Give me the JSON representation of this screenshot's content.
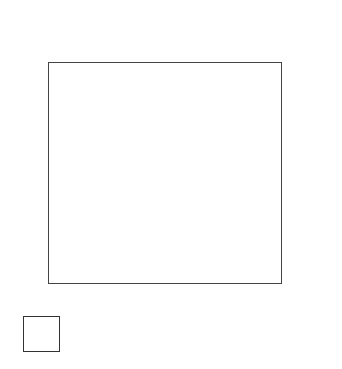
{
  "chart_data": {
    "type": "scatter",
    "xlabel": "X1",
    "ylabel": "X2",
    "x_ticks": [
      "0.2",
      "0.4",
      "0.6",
      "0.8"
    ],
    "y_ticks": [
      "0.8",
      "0.6",
      "0.4",
      "0.2"
    ],
    "xlim": [
      0,
      1
    ],
    "ylim": [
      0,
      1
    ],
    "grid_rows": 6,
    "grid_cols": 6,
    "top_strip_label": "X4",
    "right_strip_label": "X3",
    "corner_panel": {
      "x_label": "X1",
      "y_label": "X2"
    },
    "grid_on": false,
    "legend": "none"
  },
  "labels": {
    "x4": "X",
    "x4_sub": "4",
    "x2": "X",
    "x2_sub": "2",
    "x1_axis": "X",
    "x1_axis_sub": "1",
    "x1_corner": "X",
    "x1_corner_sub": "1",
    "x3": "X",
    "x3_sub": "3",
    "corner_x2": "X",
    "corner_x2_sub": "2"
  },
  "ticks": {
    "x": [
      "0.2",
      "0.4",
      "0.6",
      "0.8"
    ],
    "y": [
      "0.8",
      "0.6",
      "0.4",
      "0.2"
    ]
  },
  "top_strip": [
    [
      [
        0.05,
        0.1
      ],
      [
        0.12,
        0.15
      ],
      [
        0.2,
        0.12
      ],
      [
        0.3,
        0.2
      ],
      [
        0.4,
        0.18
      ],
      [
        0.5,
        0.25
      ],
      [
        0.6,
        0.15
      ],
      [
        0.72,
        0.28
      ],
      [
        0.85,
        0.22
      ],
      [
        0.15,
        0.08
      ]
    ],
    [
      [
        0.1,
        0.45
      ],
      [
        0.2,
        0.3
      ],
      [
        0.3,
        0.5
      ],
      [
        0.35,
        0.2
      ],
      [
        0.45,
        0.35
      ],
      [
        0.5,
        0.42
      ],
      [
        0.6,
        0.3
      ],
      [
        0.7,
        0.5
      ],
      [
        0.8,
        0.35
      ],
      [
        0.9,
        0.4
      ],
      [
        0.25,
        0.55
      ],
      [
        0.55,
        0.25
      ]
    ],
    [
      [
        0.1,
        0.5
      ],
      [
        0.12,
        0.6
      ],
      [
        0.4,
        0.45
      ],
      [
        0.5,
        0.4
      ],
      [
        0.55,
        0.5
      ],
      [
        0.65,
        0.42
      ],
      [
        0.8,
        0.45
      ],
      [
        0.6,
        0.55
      ]
    ],
    [
      [
        0.1,
        0.4
      ],
      [
        0.2,
        0.45
      ],
      [
        0.25,
        0.5
      ],
      [
        0.3,
        0.42
      ],
      [
        0.4,
        0.35
      ],
      [
        0.6,
        0.45
      ],
      [
        0.85,
        0.55
      ],
      [
        0.22,
        0.55
      ]
    ],
    [
      [
        0.1,
        0.7
      ],
      [
        0.15,
        0.75
      ],
      [
        0.25,
        0.72
      ],
      [
        0.35,
        0.7
      ],
      [
        0.45,
        0.75
      ],
      [
        0.55,
        0.78
      ],
      [
        0.65,
        0.72
      ],
      [
        0.8,
        0.75
      ],
      [
        0.2,
        0.8
      ]
    ],
    [
      [
        0.1,
        0.85
      ],
      [
        0.2,
        0.88
      ],
      [
        0.35,
        0.8
      ],
      [
        0.45,
        0.92
      ],
      [
        0.55,
        0.85
      ],
      [
        0.65,
        0.8
      ],
      [
        0.75,
        0.78
      ]
    ]
  ],
  "grid_points": [
    [
      [
        [
          0.08,
          0.08
        ],
        [
          0.15,
          0.12
        ],
        [
          0.22,
          0.06
        ]
      ],
      [
        [
          0.22,
          0.2
        ],
        [
          0.12,
          0.35
        ]
      ],
      [
        [
          0.15,
          0.22
        ],
        [
          0.15,
          0.35
        ],
        [
          0.18,
          0.3
        ]
      ],
      [
        [
          0.05,
          0.3
        ]
      ],
      [
        [
          0.12,
          0.6
        ],
        [
          0.3,
          0.62
        ]
      ],
      [
        [
          0.15,
          0.7
        ],
        [
          0.2,
          0.7
        ]
      ]
    ],
    [
      [
        [
          0.25,
          0.2
        ]
      ],
      [
        [
          0.2,
          0.3
        ],
        [
          0.2,
          0.45
        ],
        [
          0.25,
          0.5
        ],
        [
          0.35,
          0.45
        ],
        [
          0.3,
          0.55
        ]
      ],
      [],
      [
        [
          0.2,
          0.4
        ],
        [
          0.25,
          0.45
        ],
        [
          0.3,
          0.5
        ],
        [
          0.22,
          0.55
        ]
      ],
      [
        [
          0.2,
          0.6
        ],
        [
          0.3,
          0.6
        ],
        [
          0.35,
          0.62
        ]
      ],
      [
        [
          0.3,
          0.95
        ]
      ]
    ],
    [
      [
        [
          0.35,
          0.1
        ],
        [
          0.42,
          0.12
        ],
        [
          0.48,
          0.14
        ]
      ],
      [
        [
          0.32,
          0.18
        ],
        [
          0.35,
          0.28
        ]
      ],
      [
        [
          0.4,
          0.4
        ],
        [
          0.48,
          0.35
        ],
        [
          0.45,
          0.45
        ]
      ],
      [
        [
          0.2,
          0.45
        ],
        [
          0.22,
          0.55
        ],
        [
          0.25,
          0.6
        ]
      ],
      [
        [
          0.45,
          0.4
        ],
        [
          0.5,
          0.4
        ],
        [
          0.55,
          0.38
        ]
      ],
      [
        [
          0.7,
          0.6
        ],
        [
          0.75,
          0.55
        ]
      ]
    ],
    [
      [
        [
          0.45,
          0.1
        ],
        [
          0.5,
          0.12
        ],
        [
          0.55,
          0.15
        ]
      ],
      [
        [
          0.45,
          0.25
        ],
        [
          0.5,
          0.2
        ],
        [
          0.55,
          0.18
        ]
      ],
      [
        [
          0.6,
          0.3
        ],
        [
          0.62,
          0.4
        ],
        [
          0.65,
          0.5
        ]
      ],
      [
        [
          0.5,
          0.5
        ],
        [
          0.52,
          0.6
        ]
      ],
      [
        [
          0.4,
          0.6
        ],
        [
          0.45,
          0.7
        ],
        [
          0.5,
          0.65
        ]
      ],
      [
        [
          0.4,
          0.6
        ]
      ]
    ],
    [
      [
        [
          0.7,
          0.35
        ],
        [
          0.72,
          0.45
        ]
      ],
      [
        [
          0.75,
          0.3
        ],
        [
          0.8,
          0.4
        ]
      ],
      [],
      [
        [
          0.65,
          0.75
        ]
      ],
      [
        [
          0.75,
          0.7
        ],
        [
          0.8,
          0.75
        ]
      ],
      [
        [
          0.75,
          0.5
        ]
      ]
    ],
    [
      [
        [
          0.85,
          0.55
        ]
      ],
      [
        [
          0.85,
          0.6
        ],
        [
          0.9,
          0.65
        ]
      ],
      [
        [
          0.9,
          0.7
        ]
      ],
      [
        [
          0.85,
          0.85
        ]
      ],
      [
        [
          0.9,
          0.85
        ]
      ],
      [
        [
          0.9,
          0.9
        ]
      ]
    ]
  ],
  "right_strip": [
    [
      [
        0.1,
        0.1
      ],
      [
        0.2,
        0.15
      ],
      [
        0.15,
        0.25
      ],
      [
        0.25,
        0.3
      ],
      [
        0.12,
        0.4
      ],
      [
        0.2,
        0.5
      ],
      [
        0.15,
        0.6
      ],
      [
        0.1,
        0.7
      ],
      [
        0.3,
        0.7
      ],
      [
        0.2,
        0.8
      ],
      [
        0.25,
        0.2
      ],
      [
        0.35,
        0.55
      ]
    ],
    [
      [
        0.3,
        0.1
      ],
      [
        0.25,
        0.35
      ],
      [
        0.35,
        0.4
      ],
      [
        0.3,
        0.5
      ],
      [
        0.4,
        0.55
      ],
      [
        0.25,
        0.6
      ],
      [
        0.35,
        0.65
      ],
      [
        0.45,
        0.7
      ],
      [
        0.3,
        0.75
      ],
      [
        0.4,
        0.9
      ]
    ],
    [
      [
        0.35,
        0.15
      ],
      [
        0.4,
        0.25
      ],
      [
        0.45,
        0.35
      ],
      [
        0.5,
        0.4
      ],
      [
        0.38,
        0.5
      ],
      [
        0.45,
        0.6
      ],
      [
        0.35,
        0.7
      ],
      [
        0.42,
        0.85
      ],
      [
        0.5,
        0.75
      ]
    ],
    [
      [
        0.45,
        0.1
      ],
      [
        0.5,
        0.25
      ],
      [
        0.55,
        0.35
      ],
      [
        0.45,
        0.45
      ],
      [
        0.6,
        0.5
      ],
      [
        0.5,
        0.6
      ],
      [
        0.55,
        0.7
      ],
      [
        0.45,
        0.8
      ],
      [
        0.5,
        0.92
      ]
    ],
    [
      [
        0.65,
        0.1
      ],
      [
        0.7,
        0.2
      ],
      [
        0.65,
        0.35
      ],
      [
        0.75,
        0.4
      ],
      [
        0.68,
        0.75
      ],
      [
        0.72,
        0.85
      ]
    ],
    [
      [
        0.75,
        0.1
      ],
      [
        0.8,
        0.2
      ],
      [
        0.78,
        0.3
      ],
      [
        0.85,
        0.4
      ],
      [
        0.8,
        0.5
      ],
      [
        0.75,
        0.6
      ],
      [
        0.82,
        0.7
      ],
      [
        0.85,
        0.8
      ],
      [
        0.78,
        0.9
      ]
    ]
  ]
}
